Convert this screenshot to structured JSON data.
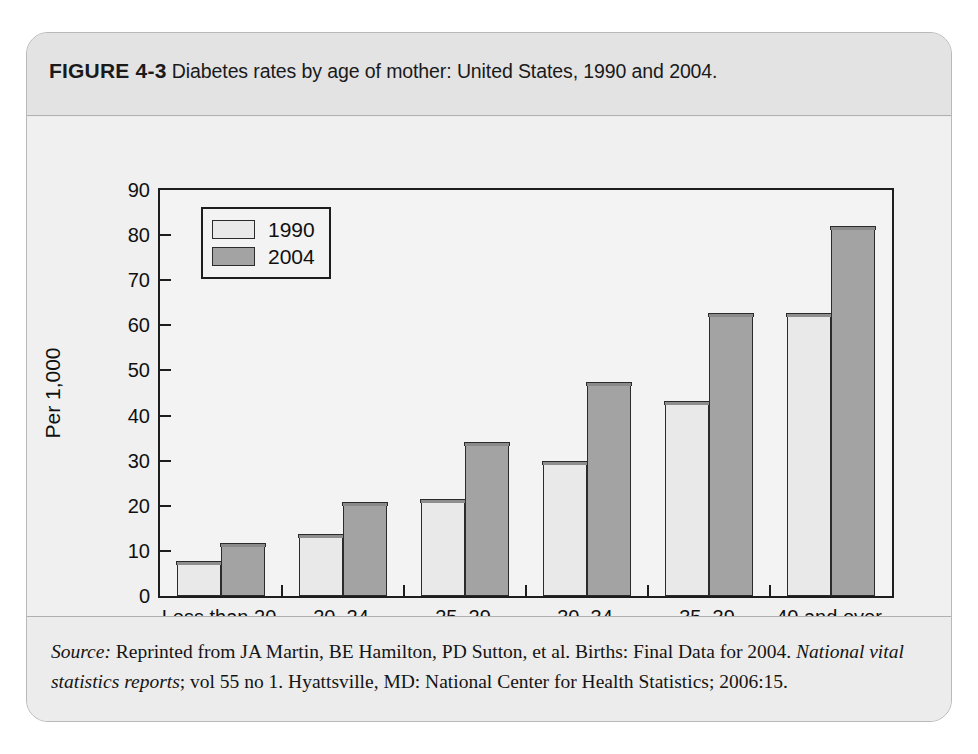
{
  "figure": {
    "label": "FIGURE 4-3",
    "caption": "Diabetes rates by age of mother: United States, 1990 and 2004.",
    "source_prefix": "Source:",
    "source_part1": " Reprinted from JA Martin, BE Hamilton, PD Sutton, et al. Births: Final Data for 2004. ",
    "source_italic1": "National vital statistics reports",
    "source_part2": "; vol 55 no 1. Hyattsville, MD: National Center for Health Statistics; 2006:15."
  },
  "colors": {
    "series_1990": "#e9e9e9",
    "series_2004": "#a3a3a3",
    "axis": "#1d1d1d",
    "panel": "#f3f3f3",
    "card": "#ececec",
    "header_band": "#e3e3e3"
  },
  "chart_data": {
    "type": "bar",
    "title": "Diabetes rates by age of mother: United States, 1990 and 2004.",
    "xlabel": "Years of age",
    "ylabel": "Per 1,000",
    "categories": [
      "Less than 20",
      "20–24",
      "25–29",
      "30–34",
      "35–39",
      "40 and over"
    ],
    "series": [
      {
        "name": "1990",
        "values": [
          7,
          13,
          20.8,
          29.2,
          42.5,
          62
        ]
      },
      {
        "name": "2004",
        "values": [
          11,
          20.2,
          33.5,
          46.7,
          62,
          81.3
        ]
      }
    ],
    "ylim": [
      0,
      90
    ],
    "yticks": [
      0,
      10,
      20,
      30,
      40,
      50,
      60,
      70,
      80,
      90
    ],
    "ytick_labels": [
      "0",
      "10",
      "20",
      "30",
      "40",
      "50",
      "60",
      "70",
      "80",
      "90"
    ],
    "grid": false,
    "legend_position": "top-left"
  }
}
